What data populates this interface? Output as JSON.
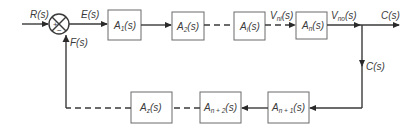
{
  "diagram": {
    "type": "block-diagram",
    "title": "",
    "signals": {
      "input": "R(s)",
      "error": "E(s)",
      "feedback": "F(s)",
      "vni": {
        "main": "V",
        "sub": "ni",
        "tail": "(s)"
      },
      "vno": {
        "main": "V",
        "sub": "no",
        "tail": "(s)"
      },
      "output": "C(s)",
      "output_branch": "C(s)"
    },
    "summing_junction": {
      "plus": "+",
      "minus": "−"
    },
    "forward_blocks": [
      {
        "main": "A",
        "sub": "1",
        "tail": "(s)"
      },
      {
        "main": "A",
        "sub": "2",
        "tail": "(s)"
      },
      {
        "main": "A",
        "sub": "i",
        "tail": "(s)"
      },
      {
        "main": "A",
        "sub": "n",
        "tail": "(s)"
      }
    ],
    "feedback_blocks": [
      {
        "main": "A",
        "sub": "n + 1",
        "tail": "(s)"
      },
      {
        "main": "A",
        "sub": "n + 2",
        "tail": "(s)"
      },
      {
        "main": "A",
        "sub": "z",
        "tail": "(s)"
      }
    ],
    "connections": [
      {
        "from": "R(s)",
        "to": "summing-junction",
        "style": "solid"
      },
      {
        "from": "summing-junction",
        "to": "A1",
        "style": "solid"
      },
      {
        "from": "A1",
        "to": "A2",
        "style": "solid"
      },
      {
        "from": "A2",
        "to": "Ai",
        "style": "dashed"
      },
      {
        "from": "Ai",
        "to": "An",
        "style": "dashed"
      },
      {
        "from": "An",
        "to": "C(s)",
        "style": "solid"
      },
      {
        "from": "C(s)",
        "to": "An+1",
        "style": "solid"
      },
      {
        "from": "An+1",
        "to": "An+2",
        "style": "solid"
      },
      {
        "from": "An+2",
        "to": "Az",
        "style": "dashed"
      },
      {
        "from": "Az",
        "to": "summing-junction",
        "style": "dashed-then-solid"
      }
    ]
  }
}
